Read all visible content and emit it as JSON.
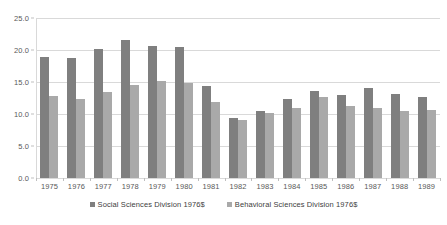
{
  "chart_data": {
    "type": "bar",
    "title": "",
    "subtitle": "",
    "xlabel": "",
    "ylabel": "",
    "ylim": [
      0.0,
      25.0
    ],
    "y_ticks": [
      "0.0",
      "5.0",
      "10.0",
      "15.0",
      "20.0",
      "25.0"
    ],
    "y_tick_values": [
      0.0,
      5.0,
      10.0,
      15.0,
      20.0,
      25.0
    ],
    "grid": "horizontal",
    "legend_position": "bottom-center",
    "categories": [
      "1975",
      "1976",
      "1977",
      "1978",
      "1979",
      "1980",
      "1981",
      "1982",
      "1983",
      "1984",
      "1985",
      "1986",
      "1987",
      "1988",
      "1989"
    ],
    "series": [
      {
        "name": "Social Sciences Division 1976$",
        "color": "#7f7f7f",
        "values": [
          18.9,
          18.8,
          20.2,
          21.6,
          20.7,
          20.4,
          14.4,
          9.4,
          10.5,
          12.3,
          13.6,
          12.9,
          14.0,
          13.1,
          12.7
        ]
      },
      {
        "name": "Behavioral Sciences Division 1976$",
        "color": "#a9a9a9",
        "values": [
          12.8,
          12.3,
          13.4,
          14.6,
          15.1,
          14.9,
          11.9,
          9.0,
          10.2,
          10.9,
          12.6,
          11.2,
          11.0,
          10.5,
          10.7
        ]
      }
    ]
  },
  "legend": {
    "items": [
      {
        "label": "Social Sciences Division 1976$"
      },
      {
        "label": "Behavioral Sciences Division 1976$"
      }
    ]
  }
}
